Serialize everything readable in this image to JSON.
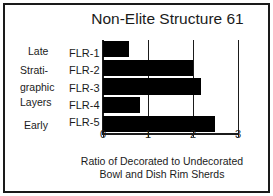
{
  "chart_data": {
    "type": "bar",
    "orientation": "horizontal",
    "title": "Non-Elite Structure 61",
    "categories": [
      "FLR-1",
      "FLR-2",
      "FLR-3",
      "FLR-4",
      "FLR-5"
    ],
    "values": [
      0.57,
      2.0,
      2.18,
      0.82,
      2.49
    ],
    "xlabel": "Ratio of Decorated to Undecorated Bowl and Dish Rim Sherds",
    "xlabel_line1": "Ratio of Decorated to Undecorated",
    "xlabel_line2": "Bowl and Dish Rim Sherds",
    "ylabel": "Stratigraphic Layers",
    "xlim": [
      0,
      3
    ],
    "xticks": [
      "0",
      "1",
      "2",
      "3"
    ],
    "xtick_values": [
      0,
      1,
      2,
      3
    ],
    "grid": true,
    "grid_axis": "x",
    "legend": false,
    "bar_color": "#000000",
    "axis_color": "#1b1b1b",
    "background": "#ffffff",
    "axis_annotations": {
      "top": "Late",
      "bottom": "Early",
      "side_label_line1": "Strati-",
      "side_label_line2": "graphic",
      "side_label_line3": "Layers"
    }
  }
}
